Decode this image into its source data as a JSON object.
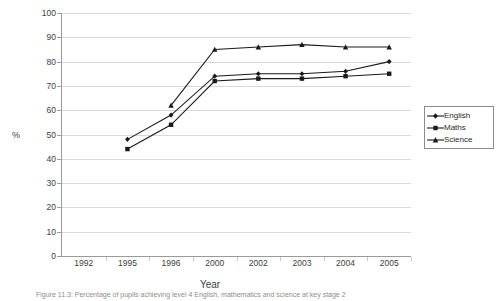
{
  "chart_data": {
    "type": "line",
    "title": "",
    "xlabel": "Year",
    "ylabel": "%",
    "categories": [
      "1992",
      "1995",
      "1996",
      "2000",
      "2002",
      "2003",
      "2004",
      "2005"
    ],
    "ylim": [
      0,
      100
    ],
    "ytick_step": 10,
    "yticks": [
      "100",
      "90",
      "80",
      "70",
      "60",
      "50",
      "40",
      "30",
      "20",
      "10",
      "0"
    ],
    "grid": true,
    "legend_position": "right",
    "series": [
      {
        "name": "English",
        "marker": "diamond",
        "color": "#1a1a1a",
        "values": [
          null,
          48,
          58,
          74,
          75,
          75,
          76,
          80
        ]
      },
      {
        "name": "Maths",
        "marker": "square",
        "color": "#1a1a1a",
        "values": [
          null,
          44,
          54,
          72,
          73,
          73,
          74,
          75
        ]
      },
      {
        "name": "Science",
        "marker": "triangle",
        "color": "#1a1a1a",
        "values": [
          null,
          null,
          62,
          85,
          86,
          87,
          86,
          86
        ]
      }
    ]
  },
  "legend": {
    "items": [
      {
        "label": "English"
      },
      {
        "label": "Maths"
      },
      {
        "label": "Science"
      }
    ]
  },
  "caption": {
    "text": "Figure 11.3: Percentage of pupils achieving level 4 English, mathematics and science at key stage 2"
  }
}
